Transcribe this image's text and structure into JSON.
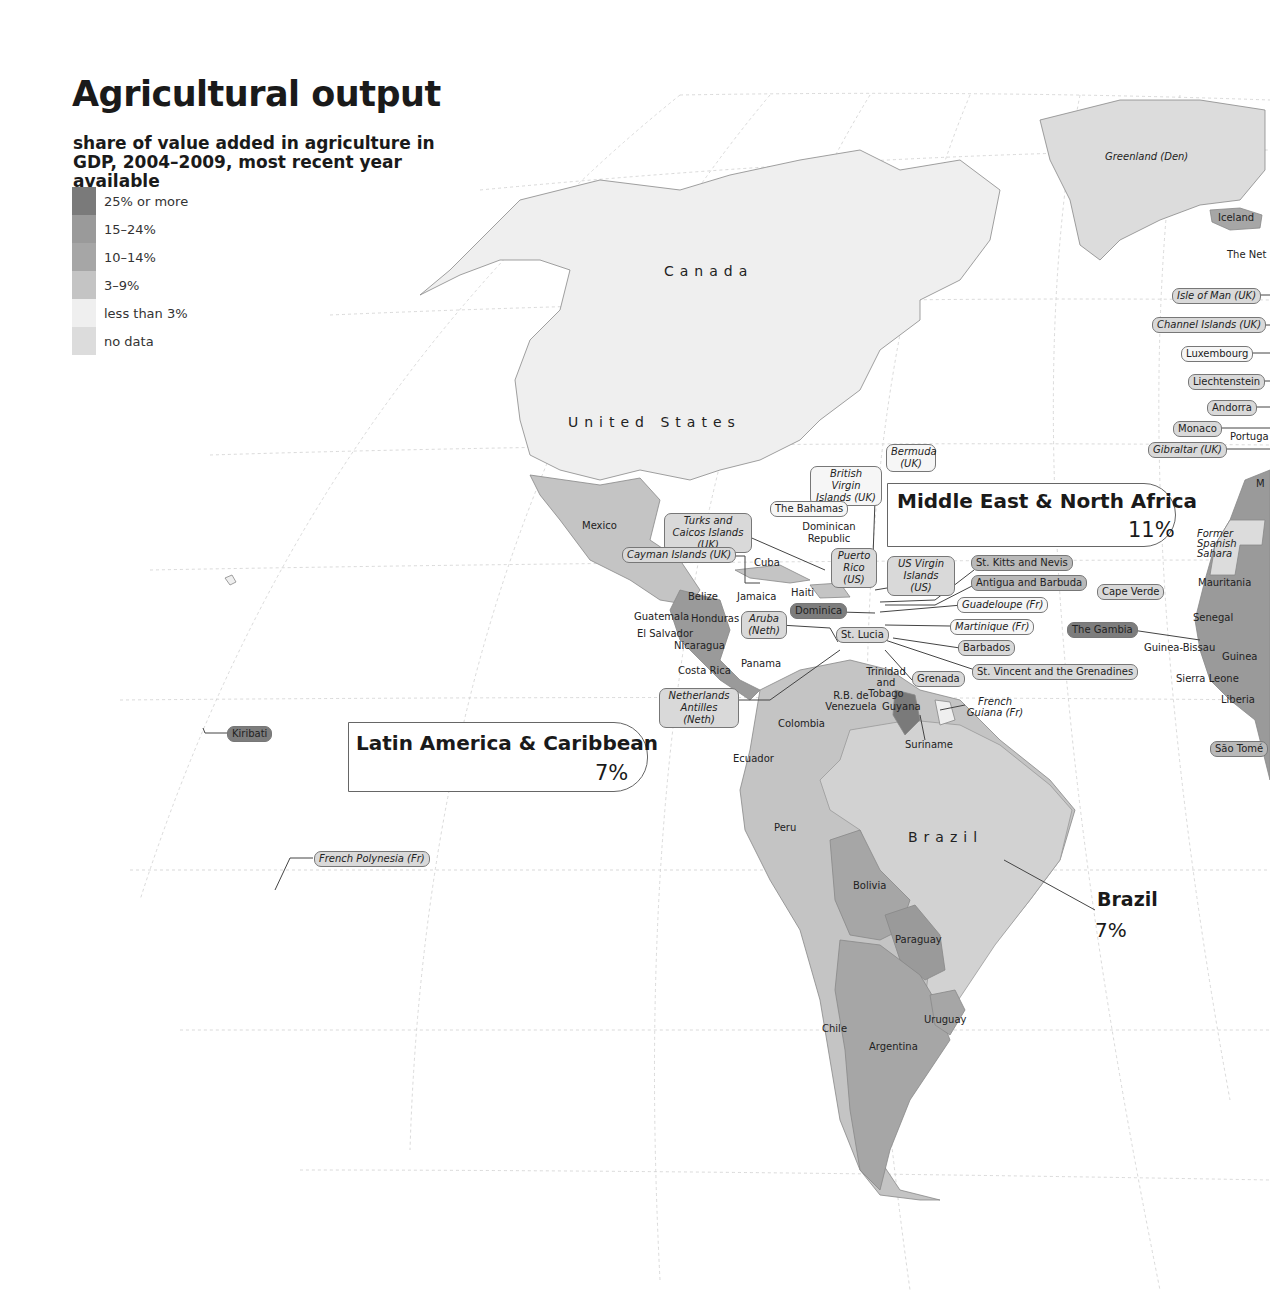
{
  "header": {
    "title": "Agricultural output",
    "subtitle": "share of value added in agriculture in GDP, 2004–2009, most recent year available"
  },
  "legend": {
    "items": [
      {
        "label": "25% or more",
        "color": "#7a7a7a"
      },
      {
        "label": "15–24%",
        "color": "#9a9a9a"
      },
      {
        "label": "10–14%",
        "color": "#a6a6a6"
      },
      {
        "label": "3–9%",
        "color": "#c4c4c4"
      },
      {
        "label": "less than 3%",
        "color": "#efefef"
      },
      {
        "label": "no data",
        "color": "#dcdcdc"
      }
    ]
  },
  "regions": {
    "mena": {
      "name": "Middle East & North Africa",
      "value": "11%"
    },
    "lac": {
      "name": "Latin America & Caribbean",
      "value": "7%"
    }
  },
  "callout": {
    "name": "Brazil",
    "value": "7%"
  },
  "map_labels": {
    "canada": "Canada",
    "united_states": "United States",
    "brazil": "Brazil",
    "mexico": "Mexico",
    "greenland": "Greenland (Den)",
    "iceland": "Iceland",
    "netherlands": "The Net",
    "portugal": "Portuga",
    "morocco": "M",
    "former_spanish_sahara": "Former Spanish Sahara",
    "mauritania": "Mauritania",
    "senegal": "Senegal",
    "guinea_bissau": "Guinea-Bissau",
    "guinea": "Guinea",
    "sierra_leone": "Sierra Leone",
    "liberia": "Liberia",
    "cuba": "Cuba",
    "jamaica": "Jamaica",
    "haiti": "Haiti",
    "dominican_republic": "Dominican Republic",
    "belize": "Belize",
    "guatemala": "Guatemala",
    "honduras": "Honduras",
    "el_salvador": "El Salvador",
    "nicaragua": "Nicaragua",
    "costa_rica": "Costa Rica",
    "panama": "Panama",
    "trinidad": "Trinidad and Tobago",
    "venezuela": "R.B. de Venezuela",
    "guyana": "Guyana",
    "suriname": "Suriname",
    "french_guiana": "French Guiana (Fr)",
    "colombia": "Colombia",
    "ecuador": "Ecuador",
    "peru": "Peru",
    "bolivia": "Bolivia",
    "paraguay": "Paraguay",
    "chile": "Chile",
    "argentina": "Argentina",
    "uruguay": "Uruguay"
  },
  "pills": {
    "isle_of_man": "Isle of Man (UK)",
    "channel_islands": "Channel Islands (UK)",
    "luxembourg": "Luxembourg",
    "liechtenstein": "Liechtenstein",
    "andorra": "Andorra",
    "monaco": "Monaco",
    "gibraltar": "Gibraltar (UK)",
    "bermuda": "Bermuda (UK)",
    "british_virgin": "British Virgin Islands (UK)",
    "bahamas": "The Bahamas",
    "turks_caicos": "Turks and Caicos Islands (UK)",
    "cayman": "Cayman Islands (UK)",
    "puerto_rico": "Puerto Rico (US)",
    "us_virgin": "US Virgin Islands (US)",
    "st_kitts": "St. Kitts and Nevis",
    "antigua": "Antigua and Barbuda",
    "guadeloupe": "Guadeloupe (Fr)",
    "martinique": "Martinique (Fr)",
    "barbados": "Barbados",
    "st_vincent": "St. Vincent and the Grenadines",
    "grenada": "Grenada",
    "dominica": "Dominica",
    "st_lucia": "St. Lucia",
    "aruba": "Aruba (Neth)",
    "neth_antilles": "Netherlands Antilles (Neth)",
    "cape_verde": "Cape Verde",
    "gambia": "The Gambia",
    "sao_tome": "São Tomé",
    "kiribati": "Kiribati",
    "french_polynesia": "French Polynesia (Fr)"
  }
}
